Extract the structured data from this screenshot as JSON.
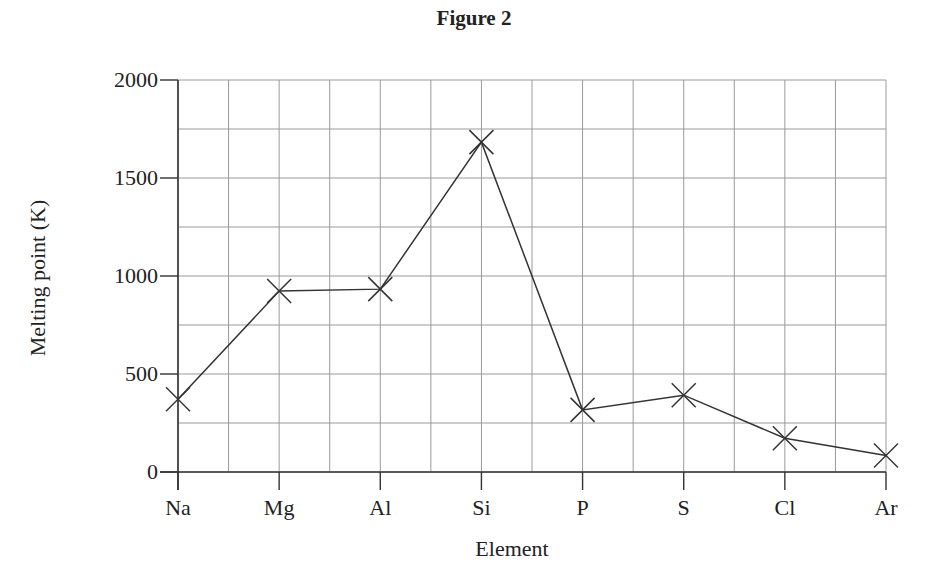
{
  "chart_data": {
    "type": "line",
    "title": "Figure 2",
    "xlabel": "Element",
    "ylabel": "Melting point (K)",
    "categories": [
      "Na",
      "Mg",
      "Al",
      "Si",
      "P",
      "S",
      "Cl",
      "Ar"
    ],
    "values": [
      371,
      923,
      933,
      1683,
      317,
      392,
      172,
      84
    ],
    "ylim": [
      0,
      2000
    ],
    "yticks": [
      0,
      500,
      1000,
      1500,
      2000
    ],
    "ytick_labels": [
      "0",
      "500",
      "1000",
      "1500",
      "2000"
    ],
    "grid": true,
    "minor_grid_y_step": 250,
    "minor_grid_x_step": 0.5,
    "marker": "x",
    "legend": null
  },
  "colors": {
    "line": "#333333",
    "grid": "#9a9a9a",
    "axis": "#333333",
    "background": "#ffffff"
  }
}
